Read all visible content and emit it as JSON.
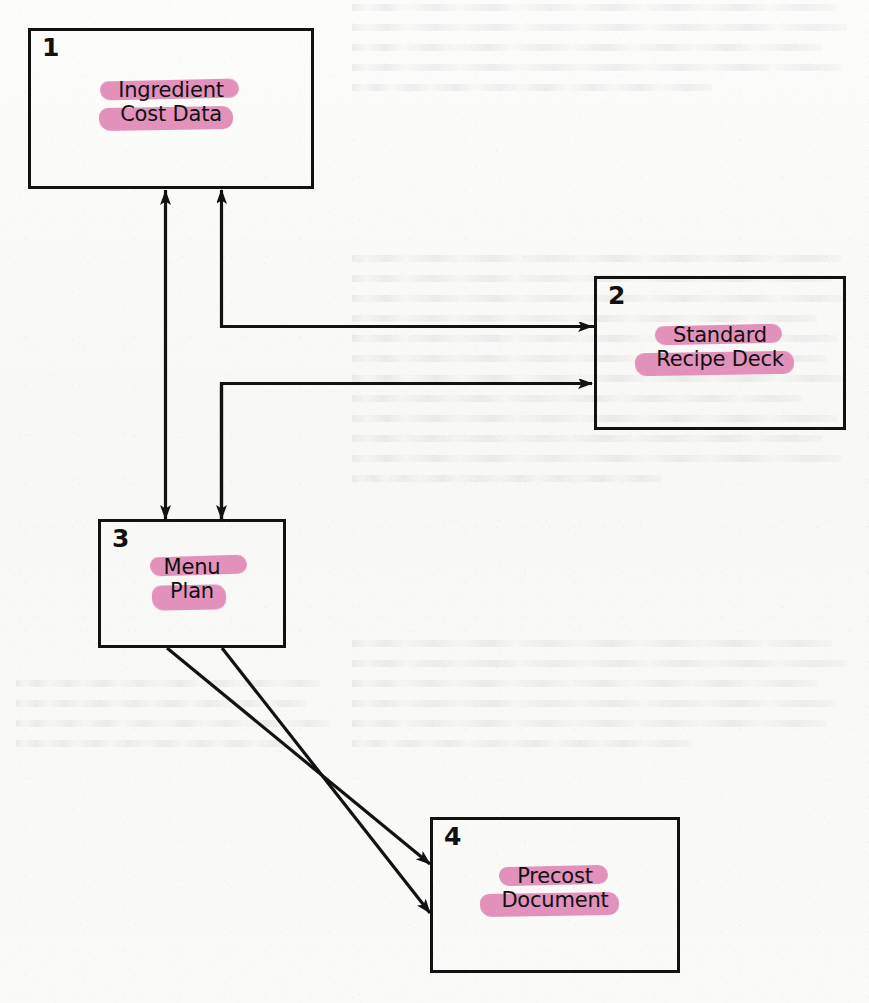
{
  "diagram": {
    "ink_color": "#121212",
    "highlighter_color": "#e189b6",
    "paper_color": "#fbfbfa",
    "nodes": [
      {
        "id": "node-1",
        "number": "1",
        "label_lines": [
          "Ingredient",
          "Cost Data"
        ],
        "label_full": "Ingredient Cost Data"
      },
      {
        "id": "node-2",
        "number": "2",
        "label_lines": [
          "Standard",
          "Recipe Deck"
        ],
        "label_full": "Standard Recipe Deck"
      },
      {
        "id": "node-3",
        "number": "3",
        "label_lines": [
          "Menu",
          "Plan"
        ],
        "label_full": "Menu Plan"
      },
      {
        "id": "node-4",
        "number": "4",
        "label_lines": [
          "Precost",
          "Document"
        ],
        "label_full": "Precost Document"
      }
    ],
    "connections": [
      {
        "id": "edge-1-3",
        "from": "node-1",
        "to": "node-3",
        "style": "orthogonal",
        "arrowheads": "both"
      },
      {
        "id": "edge-3-1",
        "from": "node-3",
        "to": "node-1",
        "style": "orthogonal",
        "arrowheads": "end"
      },
      {
        "id": "edge-1-2",
        "from": "node-1",
        "to": "node-2",
        "style": "orthogonal",
        "arrowheads": "end"
      },
      {
        "id": "edge-3-2",
        "from": "node-3",
        "to": "node-2",
        "style": "orthogonal",
        "arrowheads": "end"
      },
      {
        "id": "edge-3-4-upper",
        "from": "node-3",
        "to": "node-4",
        "style": "diagonal",
        "arrowheads": "end"
      },
      {
        "id": "edge-3-4-lower",
        "from": "node-3",
        "to": "node-4",
        "style": "diagonal",
        "arrowheads": "end"
      }
    ]
  }
}
